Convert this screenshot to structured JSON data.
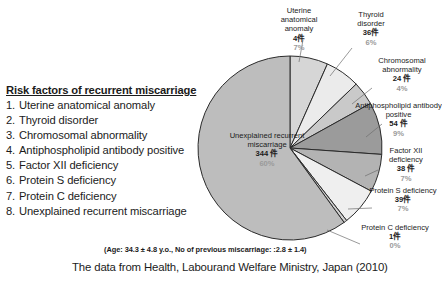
{
  "risk_list": {
    "title": "Risk factors of recurrent miscarriage",
    "items": [
      {
        "n": "1.",
        "label": "Uterine anatomical anomaly"
      },
      {
        "n": "2.",
        "label": "Thyroid disorder"
      },
      {
        "n": "3.",
        "label": "Chromosomal abnormality"
      },
      {
        "n": "4.",
        "label": "Antiphospholipid antibody positive"
      },
      {
        "n": "5.",
        "label": "Factor XII deficiency"
      },
      {
        "n": "6.",
        "label": "Protein S deficiency"
      },
      {
        "n": "7.",
        "label": "Protein C deficiency"
      },
      {
        "n": "8.",
        "label": "Unexplained recurrent miscarriage"
      }
    ]
  },
  "labels": {
    "uterine": {
      "name": "Uterine anatomical anomaly",
      "count": "4件",
      "pct": "7%"
    },
    "thyroid": {
      "name": "Thyroid disorder",
      "count": "36件",
      "pct": "6%"
    },
    "chromo": {
      "name": "Chromosomal abnormality",
      "count": "24 件",
      "pct": "4%"
    },
    "anti": {
      "name": "Antiphospholipid antibody positive",
      "count": "54 件",
      "pct": "9%"
    },
    "factor": {
      "name": "Factor XII deficiency",
      "count": "38 件",
      "pct": "7%"
    },
    "prots": {
      "name": "Protein S deficiency",
      "count": "39件",
      "pct": "7%"
    },
    "protc": {
      "name": "Protein C deficiency",
      "count": "1件",
      "pct": "0%"
    },
    "unexp": {
      "name": "Unexplained recurrent miscarriage",
      "count": "344 件",
      "pct": "60%"
    }
  },
  "captions": {
    "age": "(Age: 34.3 ± 4.8 y.o., No of previous miscarriage: :2.8 ± 1.4)",
    "source": "The data from Health, Labourand Welfare Ministry, Japan (2010)"
  },
  "chart_data": {
    "type": "pie",
    "title": "",
    "legend_position": "callout-labels",
    "start_angle_deg": 0,
    "direction": "clockwise",
    "center": {
      "x": 290,
      "y": 148
    },
    "radius": 92,
    "categories": [
      "Uterine anatomical anomaly",
      "Thyroid disorder",
      "Chromosomal abnormality",
      "Antiphospholipid antibody positive",
      "Factor XII deficiency",
      "Protein S deficiency",
      "Protein C deficiency",
      "Unexplained recurrent miscarriage"
    ],
    "values": [
      4,
      36,
      24,
      54,
      38,
      39,
      1,
      344
    ],
    "value_unit": "件",
    "percent_labels": [
      "7%",
      "6%",
      "4%",
      "9%",
      "7%",
      "7%",
      "0%",
      "60%"
    ],
    "slice_sweeps_deg": [
      24,
      22,
      15,
      33,
      24,
      24,
      2,
      216
    ],
    "colors": [
      "#d6d6d6",
      "#ebebeb",
      "#c9c9c9",
      "#9b9b9b",
      "#b3b3b3",
      "#efefef",
      "#d0d0d0",
      "#bdbdbd"
    ],
    "stroke": "#2b2b2b",
    "grid": false
  }
}
